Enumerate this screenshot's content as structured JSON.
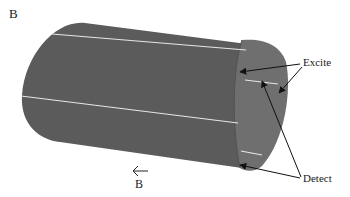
{
  "figure": {
    "panel_label": "B",
    "field_label": "B",
    "field_direction": "left",
    "labels": {
      "excite": "Excite",
      "detect": "Detect"
    },
    "colors": {
      "cylinder_body": "#5b5b5b",
      "cylinder_cap": "#6e6e6e",
      "stripe": "#e8e8e8",
      "arrow": "#111111",
      "background": "#ffffff"
    },
    "elements": [
      {
        "name": "cylinder",
        "description": "Gray cylinder viewed obliquely with white longitudinal stripes"
      },
      {
        "name": "excite-arrows",
        "count": 2
      },
      {
        "name": "detect-arrows",
        "count": 2
      }
    ]
  }
}
